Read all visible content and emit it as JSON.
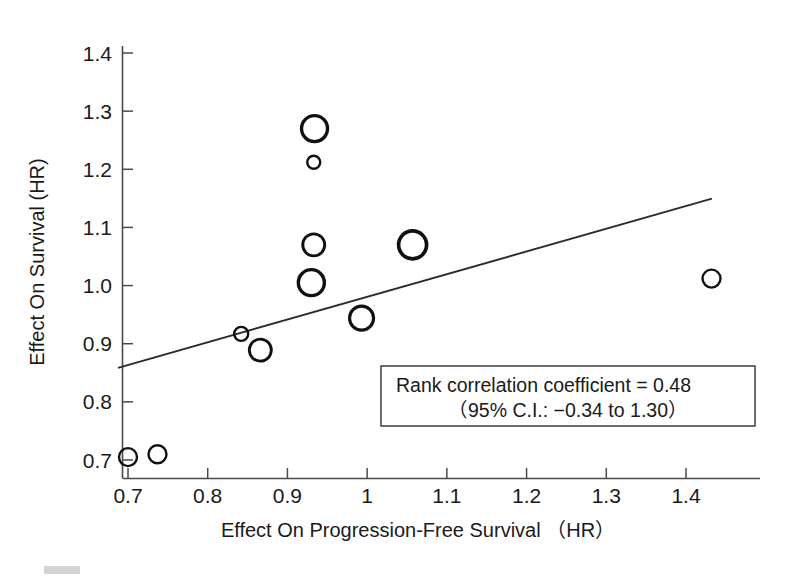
{
  "chart_data": {
    "type": "scatter",
    "title": "",
    "xlabel": "Effect On Progression-Free Survival （HR）",
    "ylabel": "Effect On Survival (HR)",
    "xlim": [
      0.66,
      1.46
    ],
    "ylim": [
      0.675,
      1.44
    ],
    "xticks": [
      "0.7",
      "0.8",
      "0.9",
      "1",
      "1.1",
      "1.2",
      "1.3",
      "1.4"
    ],
    "xtick_values": [
      0.7,
      0.8,
      0.9,
      1.0,
      1.1,
      1.2,
      1.3,
      1.4
    ],
    "yticks": [
      "0.7",
      "0.8",
      "0.9",
      "1.0",
      "1.1",
      "1.2",
      "1.3",
      "1.4"
    ],
    "ytick_values": [
      0.7,
      0.8,
      0.9,
      1.0,
      1.1,
      1.2,
      1.3,
      1.4
    ],
    "grid": false,
    "legend": "none",
    "marker": "open-circle",
    "points": [
      {
        "x": 0.7,
        "y": 0.705,
        "size": 9
      },
      {
        "x": 0.737,
        "y": 0.71,
        "size": 9
      },
      {
        "x": 0.842,
        "y": 0.917,
        "size": 7
      },
      {
        "x": 0.866,
        "y": 0.889,
        "size": 11
      },
      {
        "x": 0.93,
        "y": 1.005,
        "size": 13
      },
      {
        "x": 0.933,
        "y": 1.07,
        "size": 11
      },
      {
        "x": 0.934,
        "y": 1.27,
        "size": 13
      },
      {
        "x": 0.933,
        "y": 1.212,
        "size": 6.5
      },
      {
        "x": 0.993,
        "y": 0.944,
        "size": 12
      },
      {
        "x": 1.057,
        "y": 1.07,
        "size": 14
      },
      {
        "x": 1.432,
        "y": 1.012,
        "size": 9
      }
    ],
    "fit_line": {
      "x0": 0.6875,
      "y0": 0.8585,
      "x1": 1.4325,
      "y1": 1.1495
    },
    "annotations": [
      {
        "line1": "Rank correlation coefficient = 0.48",
        "line2": "（95% C.I.: −0.34 to 1.30）",
        "rank_correlation_coefficient": 0.48,
        "ci_low": -0.34,
        "ci_high": 1.3,
        "ci_level": "95%"
      }
    ]
  },
  "axes": {
    "x_title": "Effect On Progression-Free Survival （HR）",
    "y_title": "Effect On Survival (HR)"
  },
  "annotation": {
    "line1": "Rank correlation coefficient = 0.48",
    "line2": "（95% C.I.: −0.34 to 1.30）"
  },
  "colors": {
    "ink": "#1a1a1a",
    "axis": "#4a4a4a",
    "marker": "#111111",
    "line": "#2b2b2b",
    "background": "#ffffff"
  }
}
